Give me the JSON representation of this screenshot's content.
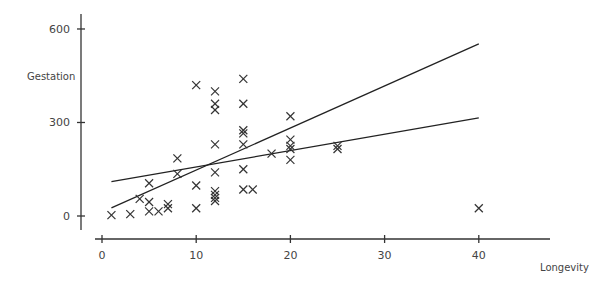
{
  "chart_data": {
    "type": "scatter",
    "title": "",
    "xlabel": "Longevity",
    "ylabel": "Gestation",
    "xlim": [
      0,
      45
    ],
    "ylim": [
      -60,
      650
    ],
    "grid": false,
    "legend": null,
    "marker": "x",
    "x_ticks": [
      0,
      10,
      20,
      30,
      40
    ],
    "y_ticks": [
      0,
      300,
      600
    ],
    "series": [
      {
        "name": "observations",
        "points": [
          [
            1,
            3
          ],
          [
            3,
            6
          ],
          [
            4,
            55
          ],
          [
            5,
            15
          ],
          [
            5,
            105
          ],
          [
            5,
            45
          ],
          [
            6,
            15
          ],
          [
            7,
            25
          ],
          [
            7,
            38
          ],
          [
            8,
            185
          ],
          [
            8,
            135
          ],
          [
            10,
            420
          ],
          [
            10,
            98
          ],
          [
            10,
            25
          ],
          [
            12,
            400
          ],
          [
            12,
            360
          ],
          [
            12,
            340
          ],
          [
            12,
            230
          ],
          [
            12,
            140
          ],
          [
            12,
            80
          ],
          [
            12,
            68
          ],
          [
            12,
            58
          ],
          [
            12,
            48
          ],
          [
            15,
            440
          ],
          [
            15,
            360
          ],
          [
            15,
            275
          ],
          [
            15,
            265
          ],
          [
            15,
            230
          ],
          [
            15,
            150
          ],
          [
            15,
            85
          ],
          [
            16,
            85
          ],
          [
            18,
            200
          ],
          [
            20,
            320
          ],
          [
            20,
            245
          ],
          [
            20,
            225
          ],
          [
            20,
            215
          ],
          [
            20,
            180
          ],
          [
            25,
            225
          ],
          [
            25,
            215
          ],
          [
            40,
            25
          ]
        ]
      }
    ],
    "lines": [
      {
        "name": "fit-line-steep",
        "from": [
          1,
          26
        ],
        "to": [
          40,
          552
        ]
      },
      {
        "name": "fit-line-shallow",
        "from": [
          1,
          110
        ],
        "to": [
          40,
          315
        ]
      }
    ]
  },
  "axes": {
    "x_label": "Longevity",
    "y_label": "Gestation",
    "x_tick_labels": [
      "0",
      "10",
      "20",
      "30",
      "40"
    ],
    "y_tick_labels": [
      "0",
      "300",
      "600"
    ]
  },
  "layout": {
    "x0_px": 102,
    "x_px_per_unit": 9.42,
    "y0_px": 216,
    "y_px_per_unit": 0.3117,
    "marker_color": "#333333"
  }
}
